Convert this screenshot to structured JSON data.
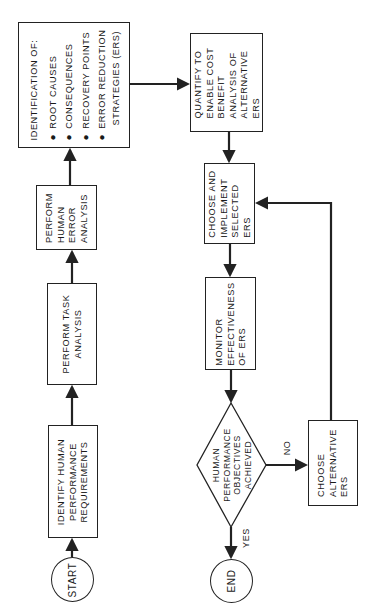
{
  "diagram": {
    "orientation": "rotated -90deg (reads bottom-to-top)",
    "nodes": {
      "start": {
        "label": "START",
        "shape": "circle"
      },
      "identify": {
        "lines": [
          "IDENTIFY HUMAN",
          "PERFORMANCE",
          "REQUIREMENTS"
        ],
        "shape": "rect"
      },
      "task": {
        "lines": [
          "PERFORM TASK",
          "ANALYSIS"
        ],
        "shape": "rect"
      },
      "error": {
        "lines": [
          "PERFORM",
          "HUMAN",
          "ERROR",
          "ANALYSIS"
        ],
        "shape": "rect"
      },
      "identification": {
        "heading": "IDENTIFICATION OF:",
        "bullets": [
          "ROOT CAUSES",
          "CONSEQUENCES",
          "RECOVERY POINTS",
          "ERROR REDUCTION",
          "STRATEGIES (ERS)"
        ],
        "shape": "rect"
      },
      "quantify": {
        "lines": [
          "QUANTIFY TO",
          "ENABLE COST",
          "BENEFIT",
          "ANALYSIS OF",
          "ALTERNATIVE",
          "ERS"
        ],
        "shape": "rect"
      },
      "choose_implement": {
        "lines": [
          "CHOOSE AND",
          "IMPLEMENT",
          "SELECTED",
          "ERS"
        ],
        "shape": "rect"
      },
      "monitor": {
        "lines": [
          "MONITOR",
          "EFFECTIVENESS",
          "OF ERS"
        ],
        "shape": "rect"
      },
      "decision": {
        "lines": [
          "HUMAN",
          "PERFORMANCE",
          "OBJECTIVES",
          "ACHIEVED"
        ],
        "shape": "diamond"
      },
      "choose_alt": {
        "lines": [
          "CHOOSE",
          "ALTERNATIVE",
          "ERS"
        ],
        "shape": "rect"
      },
      "end": {
        "label": "END",
        "shape": "circle"
      }
    },
    "edge_labels": {
      "yes": "YES",
      "no": "NO"
    },
    "edges": [
      {
        "from": "start",
        "to": "identify"
      },
      {
        "from": "identify",
        "to": "task"
      },
      {
        "from": "task",
        "to": "error"
      },
      {
        "from": "error",
        "to": "identification"
      },
      {
        "from": "identification",
        "to": "quantify"
      },
      {
        "from": "quantify",
        "to": "choose_implement"
      },
      {
        "from": "choose_implement",
        "to": "monitor"
      },
      {
        "from": "monitor",
        "to": "decision"
      },
      {
        "from": "decision",
        "to": "end",
        "label": "YES"
      },
      {
        "from": "decision",
        "to": "choose_alt",
        "label": "NO"
      },
      {
        "from": "choose_alt",
        "to": "choose_implement"
      }
    ],
    "colors": {
      "line": "#222222",
      "background": "#ffffff"
    }
  }
}
